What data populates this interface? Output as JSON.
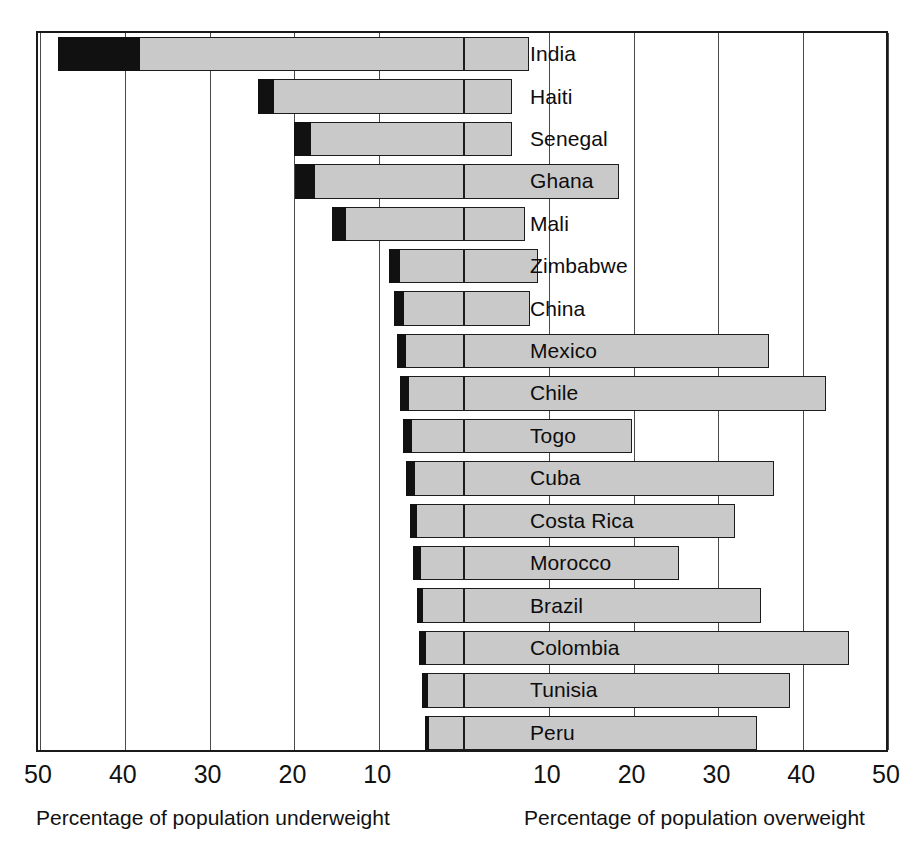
{
  "chart_data": {
    "type": "bar",
    "orientation": "horizontal",
    "style": "diverging-population-pyramid",
    "title": "",
    "subtitle": "",
    "xlabel_left": "Percentage of population underweight",
    "xlabel_right": "Percentage of population overweight",
    "ylabel": "",
    "grid": true,
    "legend_position": "none",
    "axis": {
      "left_max": 50,
      "right_max": 50,
      "center_value": 0,
      "tick_step": 10,
      "left_ticks": [
        50,
        40,
        30,
        20,
        10
      ],
      "right_ticks": [
        10,
        20,
        30,
        40,
        50
      ],
      "tick_labels_left": [
        "50",
        "40",
        "30",
        "20",
        "10"
      ],
      "tick_labels_right": [
        "10",
        "20",
        "30",
        "40",
        "50"
      ]
    },
    "categories": [
      "India",
      "Haiti",
      "Senegal",
      "Ghana",
      "Mali",
      "Zimbabwe",
      "China",
      "Mexico",
      "Chile",
      "Togo",
      "Cuba",
      "Costa Rica",
      "Morocco",
      "Brazil",
      "Colombia",
      "Tunisia",
      "Peru"
    ],
    "series": [
      {
        "name": "Percentage of population underweight",
        "side": "left",
        "color": "#c9c9c9",
        "values": [
          47.9,
          24.3,
          20.0,
          19.9,
          15.6,
          8.8,
          8.3,
          7.9,
          7.6,
          7.2,
          6.8,
          6.4,
          6.0,
          5.6,
          5.3,
          5.0,
          4.6
        ]
      },
      {
        "name": "Percentage of population severely underweight",
        "side": "left",
        "color": "#111111",
        "values": [
          38.2,
          22.4,
          18.0,
          17.6,
          13.9,
          7.6,
          7.1,
          6.8,
          6.5,
          6.1,
          5.8,
          5.5,
          5.1,
          4.8,
          4.5,
          4.2,
          4.1
        ]
      },
      {
        "name": "Percentage of population overweight",
        "side": "right",
        "color": "#c9c9c9",
        "values": [
          7.7,
          5.7,
          5.7,
          18.3,
          7.2,
          8.7,
          7.8,
          36.0,
          42.7,
          19.8,
          36.5,
          32.0,
          25.4,
          35.0,
          45.4,
          38.5,
          34.5
        ]
      }
    ]
  },
  "captions": {
    "left": "Percentage of population underweight",
    "right": "Percentage of population overweight"
  }
}
